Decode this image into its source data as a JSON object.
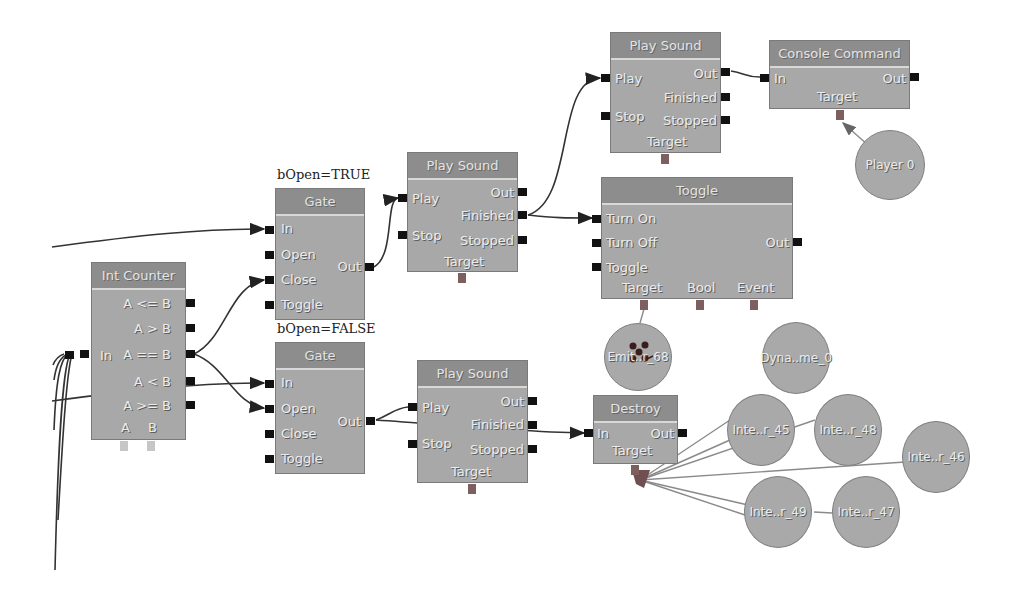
{
  "nodes": {
    "int_counter": {
      "title": "Int Counter",
      "inputs": [
        "In"
      ],
      "outputs": [
        "A <= B",
        "A > B",
        "A == B",
        "A < B",
        "A >= B"
      ],
      "vars": [
        "A",
        "B"
      ]
    },
    "gate_top": {
      "caption": "bOpen=TRUE",
      "title": "Gate",
      "inputs": [
        "In",
        "Open",
        "Close",
        "Toggle"
      ],
      "outputs": [
        "Out"
      ]
    },
    "gate_bottom": {
      "caption": "bOpen=FALSE",
      "title": "Gate",
      "inputs": [
        "In",
        "Open",
        "Close",
        "Toggle"
      ],
      "outputs": [
        "Out"
      ]
    },
    "play_sound_mid": {
      "title": "Play Sound",
      "inputs": [
        "Play",
        "Stop"
      ],
      "outputs": [
        "Out",
        "Finished",
        "Stopped"
      ],
      "vars": [
        "Target"
      ]
    },
    "play_sound_top": {
      "title": "Play Sound",
      "inputs": [
        "Play",
        "Stop"
      ],
      "outputs": [
        "Out",
        "Finished",
        "Stopped"
      ],
      "vars": [
        "Target"
      ]
    },
    "play_sound_bottom": {
      "title": "Play Sound",
      "inputs": [
        "Play",
        "Stop"
      ],
      "outputs": [
        "Out",
        "Finished",
        "Stopped"
      ],
      "vars": [
        "Target"
      ]
    },
    "console_command": {
      "title": "Console Command",
      "inputs": [
        "In"
      ],
      "outputs": [
        "Out"
      ],
      "vars": [
        "Target"
      ]
    },
    "toggle": {
      "title": "Toggle",
      "inputs": [
        "Turn On",
        "Turn Off",
        "Toggle"
      ],
      "outputs": [
        "Out"
      ],
      "vars": [
        "Target",
        "Bool",
        "Event"
      ]
    },
    "destroy": {
      "title": "Destroy",
      "inputs": [
        "In"
      ],
      "outputs": [
        "Out"
      ],
      "vars": [
        "Target"
      ]
    }
  },
  "variables": {
    "player": "Player 0",
    "emitter": "Emit..r_68",
    "dynamic": "Dyna..me_0",
    "inte45": "Inte..r_45",
    "inte48": "Inte..r_48",
    "inte46": "Inte..r_46",
    "inte49": "Inte..r_49",
    "inte47": "Inte..r_47"
  },
  "colors": {
    "background": "#ffffff",
    "node_header": "#8d8d8d",
    "node_body": "#a8a8a8",
    "connector": "#111111",
    "var_connector": "#7d5f5f",
    "wire": "#333333",
    "var_wire": "#888888"
  }
}
